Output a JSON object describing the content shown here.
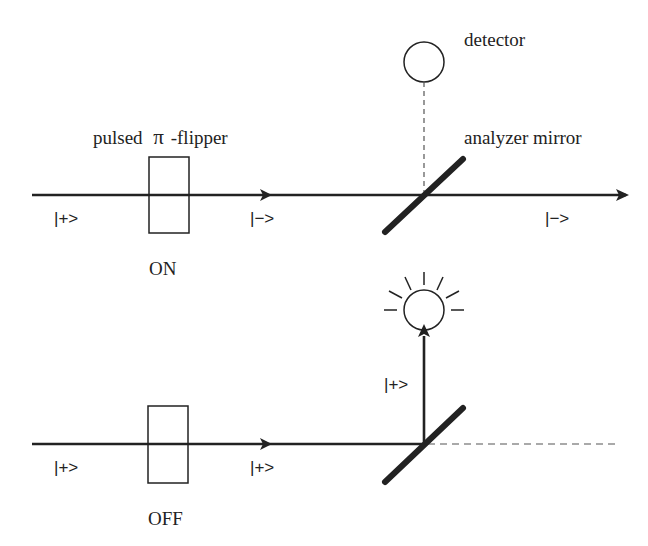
{
  "diagram": {
    "colors": {
      "ink": "#222222",
      "background": "#ffffff",
      "dashed": "#555555"
    },
    "labels": {
      "detector": "detector",
      "flipper": "pulsed",
      "flipper_symbol": "π",
      "flipper_suffix": "-flipper",
      "analyzer_mirror": "analyzer mirror"
    },
    "panels": [
      {
        "state": "ON",
        "input_state": "|+>",
        "after_flipper_state": "|−>",
        "transmitted_state": "|−>",
        "detector_lit": false
      },
      {
        "state": "OFF",
        "input_state": "|+>",
        "after_flipper_state": "|+>",
        "reflected_state": "|+>",
        "detector_lit": true
      }
    ]
  }
}
